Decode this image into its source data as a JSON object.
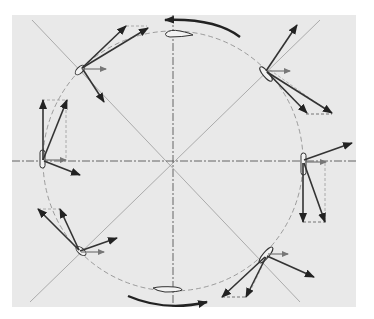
{
  "figure": {
    "type": "vertical-axis wind turbine blade force diagram",
    "background_color": "#e9e9e9",
    "page_color": "#ffffff",
    "line_color": "#333333",
    "light_line_color": "#8a8a8a",
    "vector_color": "#3a3a3a",
    "small_vector_color": "#666666",
    "center": [
      173,
      161
    ],
    "radius": 130,
    "rotation_direction": "counter-clockwise",
    "blades": [
      {
        "position": "top",
        "angle_deg": 90,
        "x": 173,
        "y": 33
      },
      {
        "position": "top-right",
        "angle_deg": 45,
        "x": 265,
        "y": 70
      },
      {
        "position": "right",
        "angle_deg": 0,
        "x": 303,
        "y": 161
      },
      {
        "position": "bottom-right",
        "angle_deg": -45,
        "x": 266,
        "y": 253
      },
      {
        "position": "bottom",
        "angle_deg": -90,
        "x": 173,
        "y": 290
      },
      {
        "position": "bottom-left",
        "angle_deg": -135,
        "x": 80,
        "y": 252
      },
      {
        "position": "left",
        "angle_deg": 180,
        "x": 42,
        "y": 161
      },
      {
        "position": "top-left",
        "angle_deg": 135,
        "x": 79,
        "y": 70
      }
    ],
    "rotation_arrows": [
      {
        "location": "top",
        "direction": "leftward"
      },
      {
        "location": "bottom",
        "direction": "rightward"
      }
    ]
  }
}
